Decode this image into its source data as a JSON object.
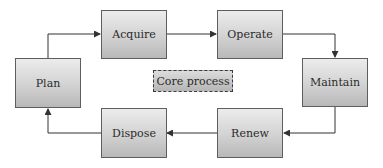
{
  "diagram": {
    "type": "cycle-flowchart",
    "nodes": [
      {
        "id": "plan",
        "label": "Plan"
      },
      {
        "id": "acquire",
        "label": "Acquire"
      },
      {
        "id": "operate",
        "label": "Operate"
      },
      {
        "id": "maintain",
        "label": "Maintain"
      },
      {
        "id": "renew",
        "label": "Renew"
      },
      {
        "id": "dispose",
        "label": "Dispose"
      }
    ],
    "edges": [
      {
        "from": "plan",
        "to": "acquire"
      },
      {
        "from": "acquire",
        "to": "operate"
      },
      {
        "from": "operate",
        "to": "maintain"
      },
      {
        "from": "maintain",
        "to": "renew"
      },
      {
        "from": "renew",
        "to": "dispose"
      },
      {
        "from": "dispose",
        "to": "plan"
      }
    ],
    "center_label": "Core process",
    "colors": {
      "border": "#5e5e5e",
      "fill_top": "#ececec",
      "fill_bottom": "#b8b8b8",
      "arrow": "#333333"
    }
  }
}
